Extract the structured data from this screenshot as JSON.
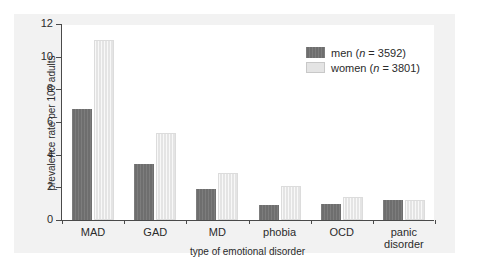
{
  "figure": {
    "background_color": "#f2f2f2",
    "plot_background_color": "#ffffff",
    "bleed_text": ""
  },
  "chart_data": {
    "type": "bar",
    "title": "",
    "xlabel": "type of emotional disorder",
    "ylabel": "prevalence rate per 100 adults",
    "categories": [
      "MAD",
      "GAD",
      "MD",
      "phobia",
      "OCD",
      "panic disorder"
    ],
    "series": [
      {
        "name": "men",
        "legend_label": "men (n = 3592)",
        "n": 3592,
        "color": "#6e6e6e",
        "values": [
          6.8,
          3.4,
          1.9,
          0.9,
          1.0,
          1.2
        ]
      },
      {
        "name": "women",
        "legend_label": "women (n = 3801)",
        "n": 3801,
        "color": "#e4e4e4",
        "values": [
          11.0,
          5.3,
          2.9,
          2.1,
          1.4,
          1.2
        ]
      }
    ],
    "ylim": [
      0,
      12
    ],
    "yticks": [
      0,
      2,
      4,
      6,
      8,
      10,
      12
    ],
    "grid": false,
    "legend_position": "top-right"
  }
}
